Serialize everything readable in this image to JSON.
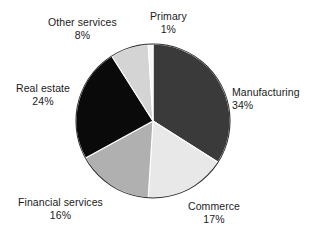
{
  "chart_data": {
    "type": "pie",
    "title": "",
    "subtitle": "",
    "xlabel": "",
    "ylabel": "",
    "legend_position": "none",
    "grid": false,
    "units": "percent",
    "total": 100,
    "start_angle_deg": 0,
    "direction": "clockwise",
    "categories": [
      "Manufacturing",
      "Commerce",
      "Financial services",
      "Real estate",
      "Other services",
      "Primary"
    ],
    "values": [
      34,
      17,
      16,
      24,
      8,
      1
    ],
    "slices": [
      {
        "label": "Manufacturing",
        "value": 34,
        "value_text": "34%",
        "color": "#3a3a3a",
        "label_x": 232,
        "label_y": 86,
        "label_align": "left"
      },
      {
        "label": "Commerce",
        "value": 17,
        "value_text": "17%",
        "color": "#e8e8e8",
        "label_x": 188,
        "label_y": 200,
        "label_align": "center"
      },
      {
        "label": "Financial services",
        "value": 16,
        "value_text": "16%",
        "color": "#b0b0b0",
        "label_x": 18,
        "label_y": 196,
        "label_align": "center"
      },
      {
        "label": "Real estate",
        "value": 24,
        "value_text": "24%",
        "color": "#0a0a0a",
        "label_x": 16,
        "label_y": 82,
        "label_align": "center"
      },
      {
        "label": "Other services",
        "value": 8,
        "value_text": "8%",
        "color": "#d4d4d4",
        "label_x": 48,
        "label_y": 16,
        "label_align": "center"
      },
      {
        "label": "Primary",
        "value": 1,
        "value_text": "1%",
        "color": "#f7f7f7",
        "label_x": 150,
        "label_y": 10,
        "label_align": "center"
      }
    ],
    "geometry": {
      "center_x": 153,
      "center_y": 121,
      "radius": 77
    },
    "colors": {
      "background": "#ffffff",
      "text": "#1a1a1a",
      "slice_border": "#ffffff",
      "pie_outline": "#2a2a2a"
    }
  }
}
